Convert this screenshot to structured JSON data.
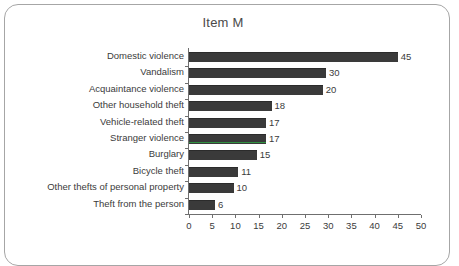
{
  "panel": {
    "border_color": "#a6a6a6",
    "background": "#ffffff"
  },
  "chart_data": {
    "type": "bar",
    "orientation": "horizontal",
    "title": "Item M",
    "xlabel": "",
    "ylabel": "",
    "xlim": [
      0,
      50
    ],
    "xticks": [
      0,
      5,
      10,
      15,
      20,
      25,
      30,
      35,
      40,
      45,
      50
    ],
    "xtick_labels": [
      "0",
      "5",
      "10",
      "15",
      "20",
      "25",
      "30",
      "35",
      "40",
      "45",
      "50"
    ],
    "grid": false,
    "legend": false,
    "bar_color": "#3a3a3a",
    "highlight_color": "#2f9140",
    "categories": [
      "Domestic violence",
      "Vandalism",
      "Acquaintance violence",
      "Other household theft",
      "Vehicle-related theft",
      "Stranger violence",
      "Burglary",
      "Bicycle theft",
      "Other thefts of personal property",
      "Theft from the person"
    ],
    "values": [
      45,
      30,
      20,
      18,
      17,
      17,
      15,
      11,
      10,
      6
    ],
    "value_labels": [
      "45",
      "30",
      "20",
      "18",
      "17",
      "17",
      "15",
      "11",
      "10",
      "6"
    ],
    "drawn_lengths": [
      45,
      29.5,
      28.8,
      17.8,
      16.6,
      16.6,
      14.6,
      10.6,
      9.6,
      5.6
    ],
    "highlighted_category": "Stranger violence"
  }
}
